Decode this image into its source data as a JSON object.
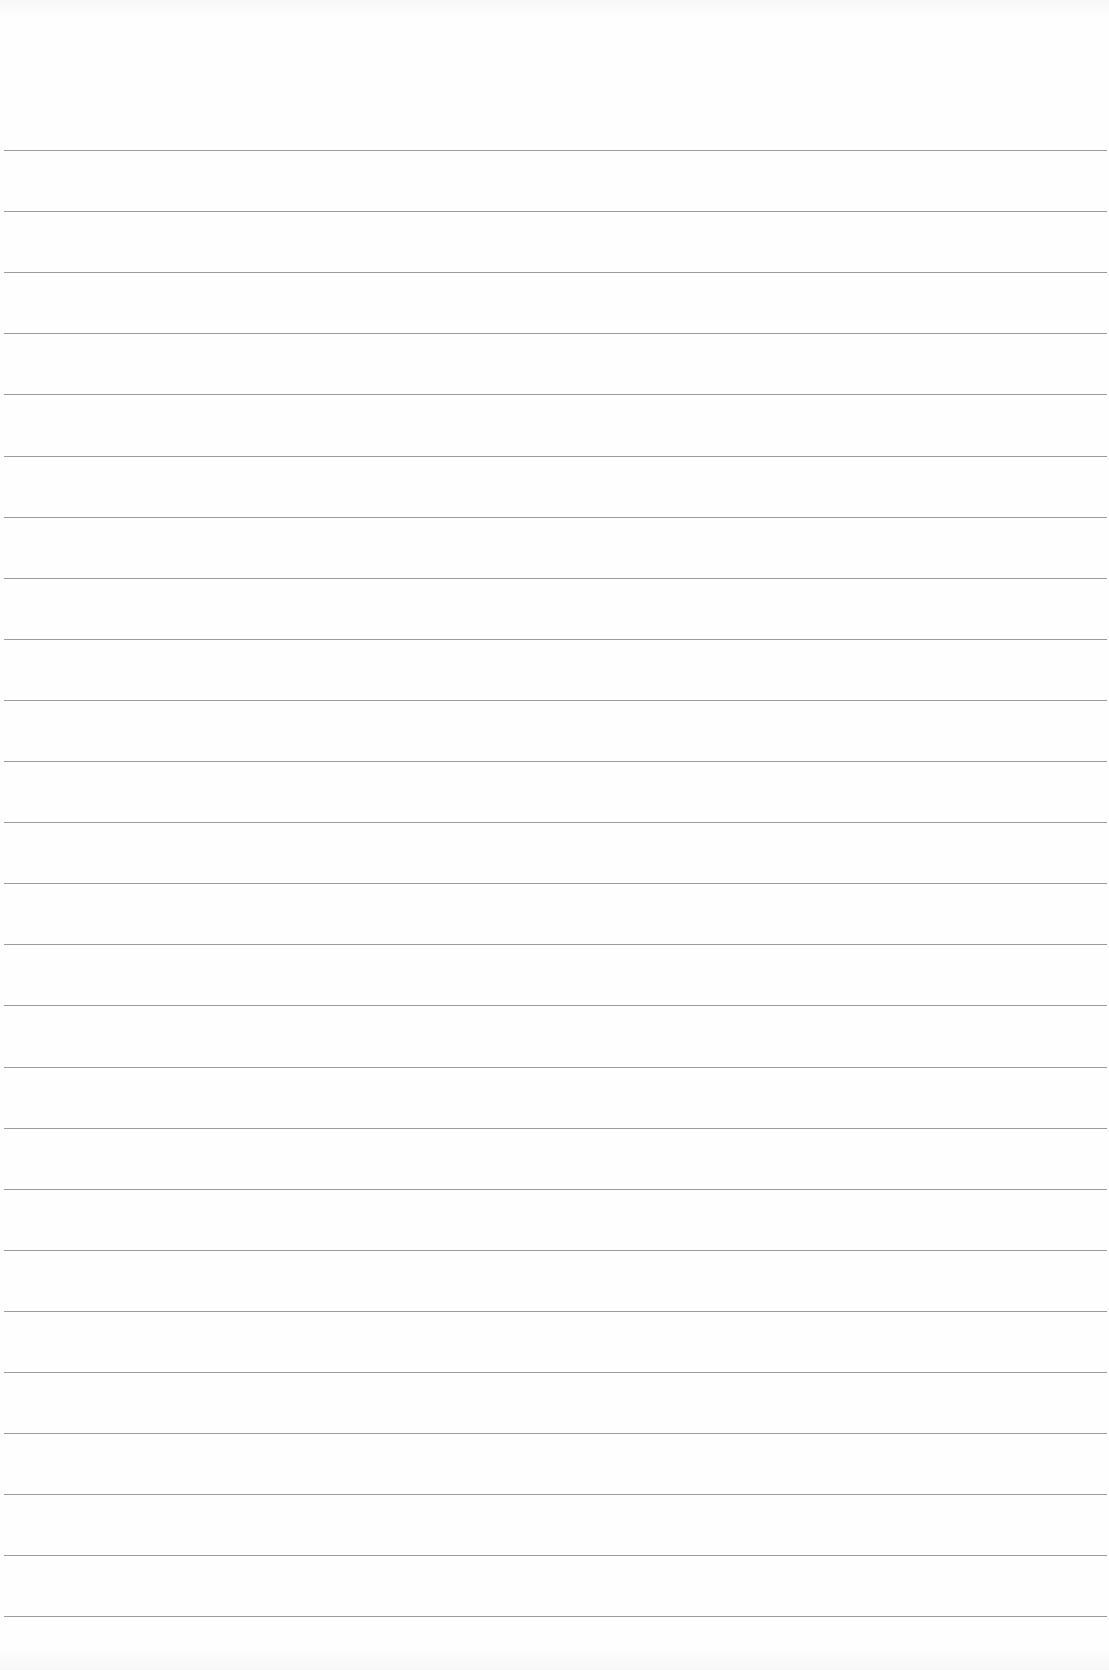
{
  "page": {
    "type": "lined-paper",
    "background_color": "#fefefe",
    "rule_color": "#8a8a8a"
  },
  "rules": {
    "count": 25,
    "first_y": 150,
    "spacing": 61.1
  }
}
